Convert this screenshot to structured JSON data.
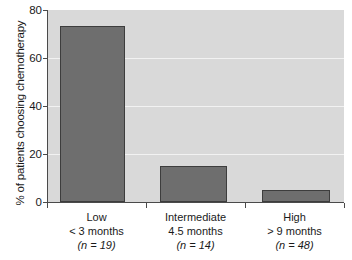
{
  "chart_data": {
    "type": "bar",
    "title": "",
    "xlabel": "",
    "ylabel": "% of patients choosing chemotherapy",
    "ylim": [
      0,
      80
    ],
    "yticks": [
      0,
      20,
      40,
      60,
      80
    ],
    "ytick_labels": [
      "0",
      "20",
      "40",
      "60",
      "80"
    ],
    "grid": true,
    "grid_axis": "y",
    "legend": "none",
    "categories": [
      "Low\n< 3 months\n(n = 19)",
      "Intermediate\n4.5 months\n(n = 14)",
      "High\n> 9 months\n(n = 48)"
    ],
    "values": [
      73.5,
      15,
      5
    ],
    "bar_color": "#6e6e6e",
    "bar_edge_color": "#3d3d3d",
    "plot_background": "#d9d9d9",
    "gridline_color": "#f2f2f2",
    "axis_color": "#4a4a4a",
    "text_color": "#1a1a1a"
  },
  "axes": {
    "y_title": "% of patients choosing chemotherapy",
    "y_ticks": [
      {
        "label": "80",
        "value": 80
      },
      {
        "label": "60",
        "value": 60
      },
      {
        "label": "40",
        "value": 40
      },
      {
        "label": "20",
        "value": 20
      },
      {
        "label": "0",
        "value": 0
      }
    ]
  },
  "categories": [
    {
      "name": "Low",
      "duration": "< 3 months",
      "count_label": "(n = 19)",
      "n": 19,
      "value": 73.5
    },
    {
      "name": "Intermediate",
      "duration": "4.5 months",
      "count_label": "(n = 14)",
      "n": 14,
      "value": 15
    },
    {
      "name": "High",
      "duration": "> 9 months",
      "count_label": "(n = 48)",
      "n": 48,
      "value": 5
    }
  ]
}
